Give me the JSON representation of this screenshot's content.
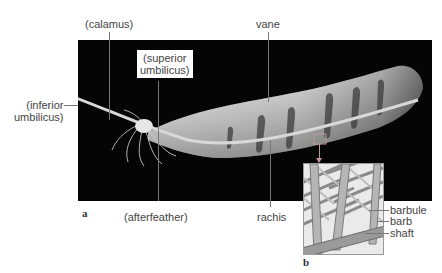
{
  "figure": {
    "panel_a": "a",
    "panel_b": "b",
    "labels": {
      "calamus": "(calamus)",
      "superior_umbilicus_1": "(superior",
      "superior_umbilicus_2": "umbilicus)",
      "inferior_umbilicus_1": "(inferior",
      "inferior_umbilicus_2": "umbilicus)",
      "vane": "vane",
      "afterfeather": "(afterfeather)",
      "rachis": "rachis",
      "barbule": "barbule",
      "barb": "barb",
      "shaft": "shaft"
    }
  }
}
